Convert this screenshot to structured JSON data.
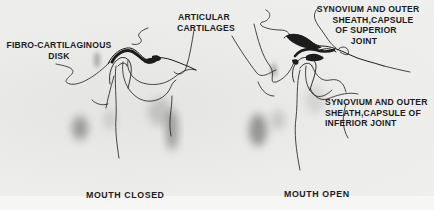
{
  "figure": {
    "panels": [
      {
        "id": "closed",
        "caption": "MOUTH CLOSED",
        "labels": {
          "disk": [
            "FIBRO-CARTILAGINOUS",
            "DISK"
          ],
          "cartilage": [
            "ARTICULAR",
            "CARTILAGES"
          ]
        }
      },
      {
        "id": "open",
        "caption": "MOUTH OPEN",
        "labels": {
          "superior": [
            "SYNOVIUM AND OUTER",
            "SHEATH,CAPSULE",
            "OF SUPERIOR",
            "JOINT"
          ],
          "inferior": [
            "SYNOVIUM AND OUTER",
            "SHEATH,CAPSULE OF",
            "INFERIOR JOINT"
          ]
        }
      }
    ],
    "colors": {
      "ink": "#1c1c1c",
      "paper": "#ebebea",
      "shade": "#6a6a6a"
    }
  }
}
